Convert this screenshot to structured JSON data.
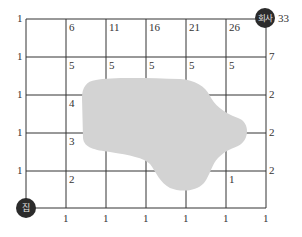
{
  "diagram": {
    "type": "grid-path-counting",
    "grid": {
      "columns": 6,
      "rows": 5,
      "left": 26,
      "top": 19,
      "cell_w": 40,
      "cell_h": 38,
      "line_color": "#333333"
    },
    "obstacle": {
      "color": "#d3d3d3",
      "description": "blocked region (cannot pass)"
    },
    "start": {
      "label": "집",
      "meaning": "home"
    },
    "end": {
      "label": "회사",
      "meaning": "company",
      "count": "33"
    },
    "left_edge_labels": [
      "1",
      "1",
      "1",
      "1",
      "1"
    ],
    "bottom_edge_labels": [
      "1",
      "1",
      "1",
      "1",
      "1",
      "1"
    ],
    "right_edge_labels": [
      "7",
      "2",
      "2",
      "2"
    ],
    "top_row_labels": [
      "6",
      "11",
      "16",
      "21",
      "26"
    ],
    "row2_labels": [
      "5",
      "5",
      "5",
      "5",
      "5"
    ],
    "inner_labels": {
      "c1r3": "4",
      "c1r4": "3",
      "c1r5": "2",
      "c5r5": "1"
    }
  }
}
